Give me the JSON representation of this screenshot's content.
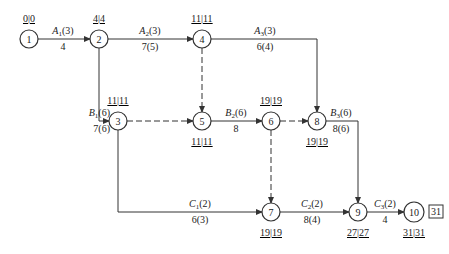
{
  "diagram": {
    "type": "activity-on-arrow network",
    "stroke_color": "#333333",
    "nodes": [
      {
        "id": "1",
        "x": 29,
        "y": 39,
        "times": "0|0",
        "times_pos": "above"
      },
      {
        "id": "2",
        "x": 99,
        "y": 39,
        "times": "4|4",
        "times_pos": "above"
      },
      {
        "id": "4",
        "x": 202,
        "y": 39,
        "times": "11|11",
        "times_pos": "above"
      },
      {
        "id": "3",
        "x": 118,
        "y": 121,
        "times": "11|11",
        "times_pos": "above"
      },
      {
        "id": "5",
        "x": 202,
        "y": 121,
        "times": "11|11",
        "times_pos": "below"
      },
      {
        "id": "6",
        "x": 271,
        "y": 121,
        "times": "19|19",
        "times_pos": "above"
      },
      {
        "id": "8",
        "x": 317,
        "y": 121,
        "times": "19|19",
        "times_pos": "below"
      },
      {
        "id": "7",
        "x": 271,
        "y": 212,
        "times": "19|19",
        "times_pos": "below"
      },
      {
        "id": "9",
        "x": 358,
        "y": 212,
        "times": "27|27",
        "times_pos": "below"
      },
      {
        "id": "10",
        "x": 414,
        "y": 212,
        "times": "31|31",
        "times_pos": "below",
        "box": "31"
      }
    ],
    "activities": [
      {
        "name": "A",
        "sub": "1",
        "dur_label": "(3)",
        "below": "4",
        "from": "1",
        "to": "2",
        "dashed": false
      },
      {
        "name": "A",
        "sub": "2",
        "dur_label": "(3)",
        "below": "7(5)",
        "from": "2",
        "to": "4",
        "dashed": false
      },
      {
        "name": "A",
        "sub": "3",
        "dur_label": "(3)",
        "below": "6(4)",
        "from": "4",
        "to": "8",
        "dashed": false
      },
      {
        "name": "B",
        "sub": "1",
        "dur_label": "(6)",
        "below": "7(6)",
        "from": "2",
        "to": "3",
        "dashed": false
      },
      {
        "name": "B",
        "sub": "2",
        "dur_label": "(6)",
        "below": "8",
        "from": "5",
        "to": "6",
        "dashed": false
      },
      {
        "name": "B",
        "sub": "3",
        "dur_label": "(6)",
        "below": "8(6)",
        "from": "8",
        "to": "9",
        "dashed": false
      },
      {
        "name": "C",
        "sub": "1",
        "dur_label": "(2)",
        "below": "6(3)",
        "from": "3",
        "to": "7",
        "dashed": false
      },
      {
        "name": "C",
        "sub": "2",
        "dur_label": "(2)",
        "below": "8(4)",
        "from": "7",
        "to": "9",
        "dashed": false
      },
      {
        "name": "C",
        "sub": "3",
        "dur_label": "(2)",
        "below": "4",
        "from": "9",
        "to": "10",
        "dashed": false
      },
      {
        "name": "dummy",
        "from": "4",
        "to": "5",
        "dashed": true
      },
      {
        "name": "dummy",
        "from": "3",
        "to": "5",
        "dashed": true
      },
      {
        "name": "dummy",
        "from": "6",
        "to": "8",
        "dashed": true
      },
      {
        "name": "dummy",
        "from": "6",
        "to": "7",
        "dashed": true
      }
    ]
  },
  "labels": {
    "n1": "1",
    "n2": "2",
    "n3": "3",
    "n4": "4",
    "n5": "5",
    "n6": "6",
    "n7": "7",
    "n8": "8",
    "n9": "9",
    "n10": "10",
    "t1": "0|0",
    "t2": "4|4",
    "t4": "11|11",
    "t3": "11|11",
    "t5": "11|11",
    "t6": "19|19",
    "t8": "19|19",
    "t7": "19|19",
    "t9": "27|27",
    "t10": "31|31",
    "box10": "31",
    "A": "A",
    "B": "B",
    "C": "C",
    "s1": "1",
    "s2": "2",
    "s3": "3",
    "d3": "(3)",
    "d6": "(6)",
    "d2": "(2)",
    "a1_below": "4",
    "a2_below": "7(5)",
    "a3_below": "6(4)",
    "b1_below": "7(6)",
    "b2_below": "8",
    "b3_below": "8(6)",
    "c1_below": "6(3)",
    "c2_below": "8(4)",
    "c3_below": "4"
  }
}
